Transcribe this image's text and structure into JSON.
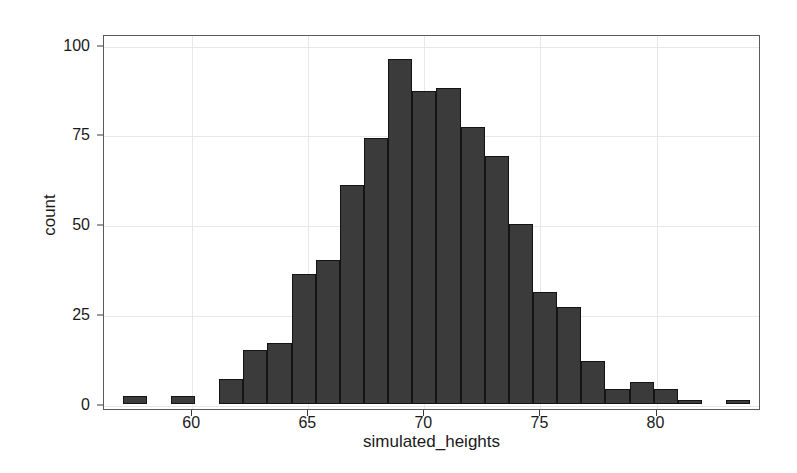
{
  "chart_data": {
    "type": "bar",
    "title": "",
    "xlabel": "simulated_heights",
    "ylabel": "count",
    "xlim": [
      56.2,
      84.5
    ],
    "ylim": [
      -1.5,
      103
    ],
    "grid": true,
    "legend": "none",
    "bin_width": 1.04,
    "xticks": [
      60,
      65,
      70,
      75,
      80
    ],
    "xtick_labels": [
      "60",
      "65",
      "70",
      "75",
      "80"
    ],
    "yticks": [
      0,
      25,
      50,
      75,
      100
    ],
    "ytick_labels": [
      "0",
      "25",
      "50",
      "75",
      "100"
    ],
    "bar_color": "#3b3b3b",
    "bar_edge_color": "#141414",
    "panel_border_color": "#5a5a5a",
    "grid_color": "#e8e8e8",
    "bins": [
      {
        "x_left": 57.0,
        "x_right": 58.04,
        "count": 2
      },
      {
        "x_left": 58.04,
        "x_right": 59.08,
        "count": 0
      },
      {
        "x_left": 59.08,
        "x_right": 60.12,
        "count": 2
      },
      {
        "x_left": 60.12,
        "x_right": 61.16,
        "count": 0
      },
      {
        "x_left": 61.16,
        "x_right": 62.2,
        "count": 7
      },
      {
        "x_left": 62.2,
        "x_right": 63.24,
        "count": 15
      },
      {
        "x_left": 63.24,
        "x_right": 64.28,
        "count": 17
      },
      {
        "x_left": 64.28,
        "x_right": 65.32,
        "count": 36
      },
      {
        "x_left": 65.32,
        "x_right": 66.36,
        "count": 40
      },
      {
        "x_left": 66.36,
        "x_right": 67.4,
        "count": 61
      },
      {
        "x_left": 67.4,
        "x_right": 68.44,
        "count": 74
      },
      {
        "x_left": 68.44,
        "x_right": 69.48,
        "count": 96
      },
      {
        "x_left": 69.48,
        "x_right": 70.52,
        "count": 87
      },
      {
        "x_left": 70.52,
        "x_right": 71.56,
        "count": 88
      },
      {
        "x_left": 71.56,
        "x_right": 72.6,
        "count": 77
      },
      {
        "x_left": 72.6,
        "x_right": 73.64,
        "count": 69
      },
      {
        "x_left": 73.64,
        "x_right": 74.68,
        "count": 50
      },
      {
        "x_left": 74.68,
        "x_right": 75.72,
        "count": 31
      },
      {
        "x_left": 75.72,
        "x_right": 76.76,
        "count": 27
      },
      {
        "x_left": 76.76,
        "x_right": 77.8,
        "count": 12
      },
      {
        "x_left": 77.8,
        "x_right": 78.84,
        "count": 4
      },
      {
        "x_left": 78.84,
        "x_right": 79.88,
        "count": 6
      },
      {
        "x_left": 79.88,
        "x_right": 80.92,
        "count": 4
      },
      {
        "x_left": 80.92,
        "x_right": 81.96,
        "count": 1
      },
      {
        "x_left": 81.96,
        "x_right": 83.0,
        "count": 0
      },
      {
        "x_left": 83.0,
        "x_right": 84.04,
        "count": 1
      }
    ]
  }
}
